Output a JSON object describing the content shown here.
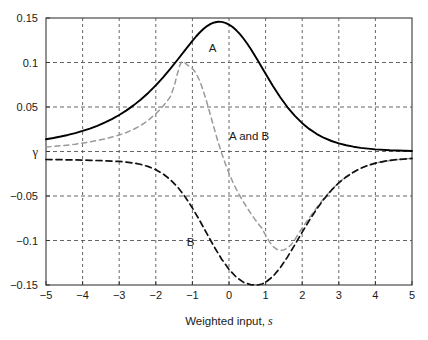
{
  "figure": {
    "background_color": "#ffffff",
    "plot_area": {
      "left": 46,
      "top": 18,
      "right": 412,
      "bottom": 285
    }
  },
  "chart_data": {
    "type": "line",
    "title": "",
    "subtitle": "",
    "xlabel": "Weighted input, s",
    "xlabel_plain": "Weighted input,",
    "xlabel_italic": "s",
    "ylabel": "γ",
    "xlim": [
      -5,
      5
    ],
    "ylim": [
      -0.15,
      0.15
    ],
    "xticks": [
      -5,
      -4,
      -3,
      -2,
      -1,
      0,
      1,
      2,
      3,
      4,
      5
    ],
    "xticklabels": [
      "−5",
      "−4",
      "−3",
      "−2",
      "−1",
      "0",
      "1",
      "2",
      "3",
      "4",
      "5"
    ],
    "yticks": [
      0.15,
      0.1,
      0.05,
      0,
      -0.05,
      -0.1,
      -0.15
    ],
    "yticklabels": [
      "0.15",
      "0.1",
      "0.05",
      "γ",
      "−0.05",
      "−0.1",
      "−0.15"
    ],
    "grid": true,
    "grid_style": "dashed",
    "grid_color": "#555555",
    "legend_position": "inline-annotations",
    "annotations": [
      {
        "text": "A",
        "x": -0.45,
        "y": 0.112,
        "name": "curve-label-a"
      },
      {
        "text": "B",
        "x": -1.05,
        "y": -0.106,
        "name": "curve-label-b"
      },
      {
        "text": "A and B",
        "x": 0.55,
        "y": 0.013,
        "name": "curve-label-a-and-b"
      }
    ],
    "series": [
      {
        "name": "A",
        "style": "solid",
        "color": "#000000",
        "width": 1.9,
        "description": "Solid bell-shaped curve peaking at 0.15 near s = -0.7",
        "points": [
          [
            -5.0,
            0.0138
          ],
          [
            -4.8,
            0.0152
          ],
          [
            -4.6,
            0.0168
          ],
          [
            -4.4,
            0.0186
          ],
          [
            -4.2,
            0.0207
          ],
          [
            -4.0,
            0.0231
          ],
          [
            -3.8,
            0.0258
          ],
          [
            -3.6,
            0.0289
          ],
          [
            -3.4,
            0.0324
          ],
          [
            -3.2,
            0.0364
          ],
          [
            -3.0,
            0.041
          ],
          [
            -2.8,
            0.0462
          ],
          [
            -2.6,
            0.0521
          ],
          [
            -2.4,
            0.0587
          ],
          [
            -2.2,
            0.0661
          ],
          [
            -2.0,
            0.0743
          ],
          [
            -1.8,
            0.0833
          ],
          [
            -1.6,
            0.0931
          ],
          [
            -1.4,
            0.1034
          ],
          [
            -1.2,
            0.1139
          ],
          [
            -1.0,
            0.1243
          ],
          [
            -0.9,
            0.1292
          ],
          [
            -0.8,
            0.1337
          ],
          [
            -0.7,
            0.1376
          ],
          [
            -0.6,
            0.1409
          ],
          [
            -0.5,
            0.1434
          ],
          [
            -0.4,
            0.145
          ],
          [
            -0.3,
            0.1458
          ],
          [
            -0.2,
            0.1456
          ],
          [
            -0.1,
            0.1446
          ],
          [
            0.0,
            0.1426
          ],
          [
            0.1,
            0.1398
          ],
          [
            0.2,
            0.1362
          ],
          [
            0.3,
            0.1318
          ],
          [
            0.4,
            0.1267
          ],
          [
            0.5,
            0.121
          ],
          [
            0.6,
            0.1148
          ],
          [
            0.8,
            0.1014
          ],
          [
            1.0,
            0.0874
          ],
          [
            1.2,
            0.0737
          ],
          [
            1.4,
            0.061
          ],
          [
            1.6,
            0.0497
          ],
          [
            1.8,
            0.04
          ],
          [
            2.0,
            0.0318
          ],
          [
            2.2,
            0.0251
          ],
          [
            2.4,
            0.0196
          ],
          [
            2.6,
            0.0152
          ],
          [
            2.8,
            0.0118
          ],
          [
            3.0,
            0.0091
          ],
          [
            3.2,
            0.007
          ],
          [
            3.4,
            0.0054
          ],
          [
            3.6,
            0.0041
          ],
          [
            3.8,
            0.0032
          ],
          [
            4.0,
            0.0024
          ],
          [
            4.4,
            0.0014
          ],
          [
            4.8,
            0.0008
          ],
          [
            5.0,
            0.0006
          ]
        ]
      },
      {
        "name": "B",
        "style": "dashed",
        "color": "#111111",
        "width": 1.7,
        "description": "Dark dashed curve, flat near -0.01 on the left, dipping to -0.15 near s = 0.78, recovering to about -0.015 at s = 5",
        "points": [
          [
            -5.0,
            -0.009
          ],
          [
            -4.6,
            -0.0092
          ],
          [
            -4.2,
            -0.0095
          ],
          [
            -3.8,
            -0.0099
          ],
          [
            -3.4,
            -0.0104
          ],
          [
            -3.0,
            -0.0112
          ],
          [
            -2.8,
            -0.0119
          ],
          [
            -2.6,
            -0.013
          ],
          [
            -2.4,
            -0.0146
          ],
          [
            -2.2,
            -0.017
          ],
          [
            -2.0,
            -0.0204
          ],
          [
            -1.8,
            -0.0252
          ],
          [
            -1.6,
            -0.0317
          ],
          [
            -1.4,
            -0.0402
          ],
          [
            -1.2,
            -0.0508
          ],
          [
            -1.0,
            -0.0634
          ],
          [
            -0.8,
            -0.0776
          ],
          [
            -0.6,
            -0.0926
          ],
          [
            -0.4,
            -0.1074
          ],
          [
            -0.2,
            -0.121
          ],
          [
            0.0,
            -0.1324
          ],
          [
            0.2,
            -0.1412
          ],
          [
            0.4,
            -0.147
          ],
          [
            0.6,
            -0.1497
          ],
          [
            0.78,
            -0.15
          ],
          [
            0.9,
            -0.1489
          ],
          [
            1.0,
            -0.147
          ],
          [
            1.2,
            -0.1404
          ],
          [
            1.4,
            -0.1306
          ],
          [
            1.6,
            -0.1184
          ],
          [
            1.8,
            -0.1047
          ],
          [
            2.0,
            -0.0906
          ],
          [
            2.2,
            -0.077
          ],
          [
            2.4,
            -0.0644
          ],
          [
            2.6,
            -0.0532
          ],
          [
            2.8,
            -0.0435
          ],
          [
            3.0,
            -0.0353
          ],
          [
            3.2,
            -0.0286
          ],
          [
            3.4,
            -0.0232
          ],
          [
            3.6,
            -0.0189
          ],
          [
            3.8,
            -0.0156
          ],
          [
            4.0,
            -0.0131
          ],
          [
            4.3,
            -0.0106
          ],
          [
            4.6,
            -0.009
          ],
          [
            5.0,
            -0.0078
          ]
        ]
      },
      {
        "name": "gray-dashed",
        "style": "dashed",
        "color": "#9a9a9a",
        "width": 1.5,
        "description": "Light gray dashed curve: rises to 0.101 near s = -1.3, crosses zero near s = -0.15, dips to -0.111 near s = 1.4, then rises and merges with curve B beyond s = 3",
        "points": [
          [
            -5.0,
            0.005
          ],
          [
            -4.6,
            0.0064
          ],
          [
            -4.2,
            0.0082
          ],
          [
            -3.8,
            0.0107
          ],
          [
            -3.4,
            0.014
          ],
          [
            -3.0,
            0.0185
          ],
          [
            -2.8,
            0.0214
          ],
          [
            -2.6,
            0.025
          ],
          [
            -2.4,
            0.0296
          ],
          [
            -2.2,
            0.0353
          ],
          [
            -2.0,
            0.0424
          ],
          [
            -1.9,
            0.0465
          ],
          [
            -1.8,
            0.0511
          ],
          [
            -1.7,
            0.0561
          ],
          [
            -1.6,
            0.0617
          ],
          [
            -1.5,
            0.0729
          ],
          [
            -1.42,
            0.086
          ],
          [
            -1.35,
            0.096
          ],
          [
            -1.3,
            0.1006
          ],
          [
            -1.25,
            0.1012
          ],
          [
            -1.2,
            0.0995
          ],
          [
            -1.15,
            0.0976
          ],
          [
            -1.1,
            0.0961
          ],
          [
            -1.0,
            0.0932
          ],
          [
            -0.9,
            0.088
          ],
          [
            -0.8,
            0.0795
          ],
          [
            -0.7,
            0.068
          ],
          [
            -0.6,
            0.0545
          ],
          [
            -0.5,
            0.04
          ],
          [
            -0.4,
            0.0252
          ],
          [
            -0.3,
            0.011
          ],
          [
            -0.2,
            -0.002
          ],
          [
            -0.1,
            -0.0138
          ],
          [
            0.0,
            -0.0245
          ],
          [
            0.1,
            -0.034
          ],
          [
            0.2,
            -0.0424
          ],
          [
            0.3,
            -0.05
          ],
          [
            0.4,
            -0.057
          ],
          [
            0.5,
            -0.0636
          ],
          [
            0.6,
            -0.0698
          ],
          [
            0.7,
            -0.0757
          ],
          [
            0.8,
            -0.0812
          ],
          [
            0.9,
            -0.0862
          ],
          [
            1.0,
            -0.0941
          ],
          [
            1.1,
            -0.1011
          ],
          [
            1.2,
            -0.1066
          ],
          [
            1.3,
            -0.1098
          ],
          [
            1.4,
            -0.111
          ],
          [
            1.5,
            -0.1106
          ],
          [
            1.6,
            -0.1085
          ],
          [
            1.7,
            -0.1046
          ],
          [
            1.8,
            -0.099
          ],
          [
            1.9,
            -0.092
          ],
          [
            2.0,
            -0.086
          ],
          [
            2.1,
            -0.08
          ],
          [
            2.2,
            -0.0742
          ],
          [
            2.4,
            -0.0628
          ],
          [
            2.6,
            -0.0522
          ],
          [
            2.8,
            -0.043
          ],
          [
            3.0,
            -0.035
          ],
          [
            3.2,
            -0.0284
          ],
          [
            3.4,
            -0.023
          ],
          [
            3.6,
            -0.0187
          ],
          [
            3.8,
            -0.0155
          ],
          [
            4.0,
            -0.013
          ],
          [
            4.4,
            -0.01
          ],
          [
            4.7,
            -0.0086
          ],
          [
            5.0,
            -0.0078
          ]
        ]
      }
    ]
  }
}
